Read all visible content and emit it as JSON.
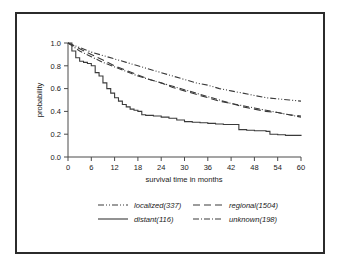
{
  "figure": {
    "border_color": "#2b2b2b",
    "background": "#ffffff"
  },
  "chart_data": {
    "type": "line",
    "title": "",
    "subtitle": "",
    "xlabel": "survival time in months",
    "ylabel": "probability",
    "xlim": [
      0,
      60
    ],
    "ylim": [
      0.0,
      1.0
    ],
    "xticks": [
      0,
      6,
      12,
      18,
      24,
      30,
      36,
      42,
      48,
      54,
      60
    ],
    "xtick_labels": [
      "0",
      "6",
      "12",
      "18",
      "24",
      "30",
      "36",
      "42",
      "48",
      "54",
      "60"
    ],
    "yticks": [
      0.0,
      0.2,
      0.4,
      0.6,
      0.8,
      1.0
    ],
    "ytick_labels": [
      "0.0",
      "0.2",
      "0.4",
      "0.6",
      "0.8",
      "1.0"
    ],
    "grid": false,
    "legend_position": "below",
    "line_color": "#3a3a3a",
    "series": [
      {
        "name": "localized(337)",
        "label": "localized(337)",
        "dash": "dashdotdot",
        "dasharray": "6,2,1,2,1,2",
        "x": [
          0,
          3,
          6,
          9,
          12,
          15,
          18,
          21,
          24,
          27,
          30,
          33,
          36,
          39,
          42,
          45,
          48,
          51,
          54,
          57,
          60
        ],
        "y": [
          1.0,
          0.96,
          0.92,
          0.89,
          0.86,
          0.83,
          0.8,
          0.77,
          0.74,
          0.71,
          0.68,
          0.65,
          0.63,
          0.6,
          0.58,
          0.56,
          0.54,
          0.52,
          0.51,
          0.5,
          0.49
        ]
      },
      {
        "name": "regional(1504)",
        "label": "regional(1504)",
        "dash": "dashed",
        "dasharray": "7,4",
        "x": [
          0,
          3,
          6,
          9,
          12,
          15,
          18,
          21,
          24,
          27,
          30,
          33,
          36,
          39,
          42,
          45,
          48,
          51,
          54,
          57,
          60
        ],
        "y": [
          1.0,
          0.95,
          0.9,
          0.85,
          0.8,
          0.76,
          0.72,
          0.68,
          0.65,
          0.61,
          0.58,
          0.55,
          0.52,
          0.49,
          0.47,
          0.44,
          0.42,
          0.4,
          0.39,
          0.37,
          0.36
        ]
      },
      {
        "name": "distant(116)",
        "label": "distant(116)",
        "dash": "solid",
        "dasharray": "none",
        "x": [
          0,
          1,
          2,
          3,
          4,
          5,
          6,
          7,
          8,
          9,
          10,
          11,
          12,
          13,
          14,
          15,
          16,
          17,
          18,
          19,
          20,
          22,
          24,
          26,
          28,
          30,
          32,
          34,
          36,
          38,
          40,
          42,
          43,
          44,
          46,
          48,
          50,
          51,
          52,
          54,
          56,
          58,
          60
        ],
        "y": [
          1.0,
          0.93,
          0.87,
          0.84,
          0.83,
          0.82,
          0.8,
          0.74,
          0.71,
          0.65,
          0.6,
          0.56,
          0.52,
          0.49,
          0.46,
          0.44,
          0.42,
          0.41,
          0.4,
          0.37,
          0.365,
          0.36,
          0.35,
          0.34,
          0.325,
          0.31,
          0.305,
          0.3,
          0.295,
          0.29,
          0.285,
          0.285,
          0.285,
          0.24,
          0.235,
          0.23,
          0.23,
          0.225,
          0.2,
          0.195,
          0.19,
          0.19,
          0.185
        ]
      },
      {
        "name": "unknown(198)",
        "label": "unknown(198)",
        "dash": "dashdot",
        "dasharray": "6,2,1,2",
        "x": [
          0,
          3,
          6,
          9,
          12,
          15,
          18,
          21,
          24,
          27,
          30,
          33,
          36,
          39,
          42,
          45,
          48,
          51,
          54,
          57,
          60
        ],
        "y": [
          1.0,
          0.93,
          0.88,
          0.83,
          0.79,
          0.75,
          0.71,
          0.68,
          0.65,
          0.62,
          0.59,
          0.56,
          0.53,
          0.5,
          0.47,
          0.45,
          0.43,
          0.41,
          0.39,
          0.37,
          0.35
        ]
      }
    ]
  },
  "legend": {
    "entries": [
      {
        "label": "localized(337)",
        "dasharray": "6,2,1,2,1,2"
      },
      {
        "label": "regional(1504)",
        "dasharray": "7,4"
      },
      {
        "label": "distant(116)",
        "dasharray": "none"
      },
      {
        "label": "unknown(198)",
        "dasharray": "6,2,1,2"
      }
    ]
  }
}
